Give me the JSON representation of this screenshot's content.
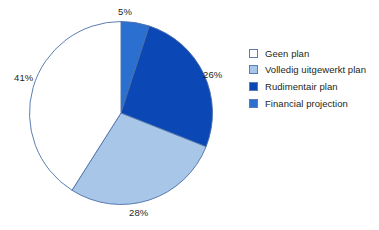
{
  "chart_data": {
    "type": "pie",
    "title": "",
    "slices": [
      {
        "label": "Financial projection",
        "value": 5,
        "display": "5%",
        "color": "#2B6FD0"
      },
      {
        "label": "Rudimentair plan",
        "value": 26,
        "display": "26%",
        "color": "#0B47B5"
      },
      {
        "label": "Volledig uitgewerkt plan",
        "value": 28,
        "display": "28%",
        "color": "#A8C6E8"
      },
      {
        "label": "Geen plan",
        "value": 41,
        "display": "41%",
        "color": "#FFFFFF"
      }
    ],
    "start_angle_deg": 0,
    "direction": "clockwise",
    "total": 100,
    "units": "percent",
    "outline_color": "#4A6FA8",
    "legend_position": "right"
  },
  "labels": {
    "top": "5%",
    "right": "26%",
    "bottom": "28%",
    "left": "41%"
  },
  "legend": {
    "items": [
      {
        "label": "Geen plan",
        "color": "#FFFFFF"
      },
      {
        "label": "Volledig uitgewerkt plan",
        "color": "#A8C6E8"
      },
      {
        "label": "Rudimentair plan",
        "color": "#0B47B5"
      },
      {
        "label": "Financial projection",
        "color": "#2B6FD0"
      }
    ]
  }
}
